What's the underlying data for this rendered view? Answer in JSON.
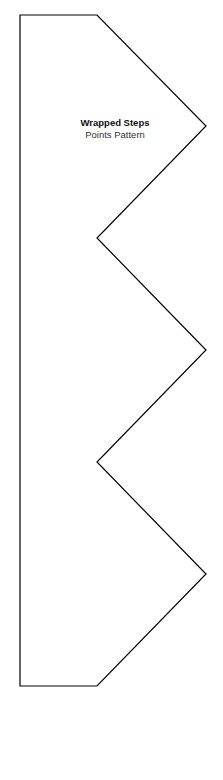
{
  "diagram": {
    "title": "Wrapped Steps",
    "subtitle": "Points Pattern",
    "stroke_color": "#000000",
    "fill_color": "#ffffff"
  }
}
